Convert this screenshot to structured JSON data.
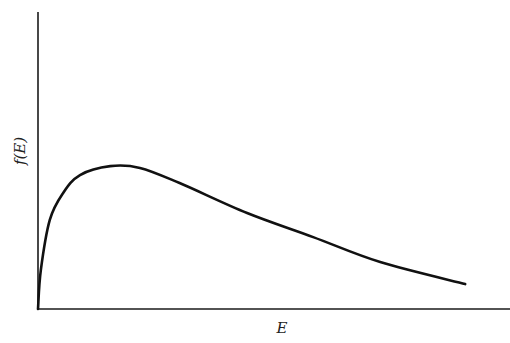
{
  "chart_data": {
    "type": "line",
    "title": "",
    "xlabel": "E",
    "ylabel": "f(E)",
    "xlim": [
      0,
      10
    ],
    "ylim": [
      0,
      10
    ],
    "grid": false,
    "ticks": false,
    "legend": null,
    "series": [
      {
        "name": "f(E)",
        "x": [
          0,
          0.06,
          0.25,
          0.53,
          0.89,
          1.53,
          2.16,
          3.0,
          4.43,
          5.83,
          7.25,
          9.05
        ],
        "y": [
          0,
          1.31,
          3.0,
          3.9,
          4.51,
          4.81,
          4.75,
          4.24,
          3.23,
          2.42,
          1.58,
          0.84
        ]
      }
    ]
  },
  "colors": {
    "background": "#ffffff",
    "line": "#111111",
    "axis": "#1a1a1a"
  }
}
